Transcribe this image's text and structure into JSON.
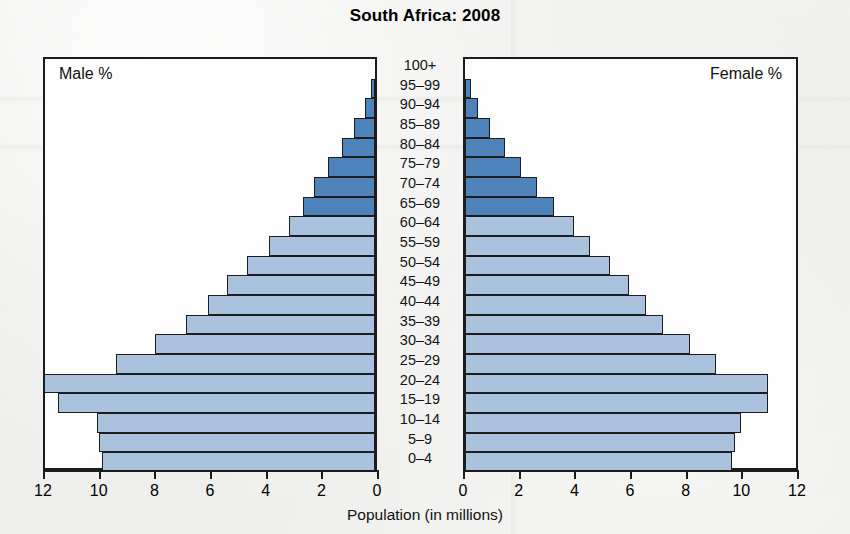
{
  "chart_data": {
    "type": "bar",
    "subtype": "population-pyramid",
    "title": "South Africa: 2008",
    "xlabel": "Population (in millions)",
    "ylabel": "",
    "grid": false,
    "legend_position": "inside-panels",
    "panels": [
      {
        "name": "male",
        "label": "Male %",
        "direction": "left"
      },
      {
        "name": "female",
        "label": "Female %",
        "direction": "right"
      }
    ],
    "axis": {
      "left_ticks": [
        12,
        10,
        8,
        6,
        4,
        2,
        0
      ],
      "right_ticks": [
        0,
        2,
        4,
        6,
        8,
        10,
        12
      ],
      "xlim": [
        0,
        12
      ],
      "units": "millions"
    },
    "categories": [
      "100+",
      "95–99",
      "90–94",
      "85–89",
      "80–84",
      "75–79",
      "70–74",
      "65–69",
      "60–64",
      "55–59",
      "50–54",
      "45–49",
      "40–44",
      "35–39",
      "30–34",
      "25–29",
      "20–24",
      "15–19",
      "10–14",
      "5–9",
      "0–4"
    ],
    "series": [
      {
        "name": "Male",
        "color": "#abc2de",
        "highlight_color": "#4d82bb",
        "values": [
          0.0,
          0.15,
          0.35,
          0.75,
          1.2,
          1.7,
          2.2,
          2.6,
          3.1,
          3.8,
          4.6,
          5.3,
          6.0,
          6.8,
          7.9,
          9.3,
          11.9,
          11.4,
          10.0,
          9.9,
          9.8
        ]
      },
      {
        "name": "Female",
        "color": "#abc2de",
        "highlight_color": "#4d82bb",
        "values": [
          0.0,
          0.2,
          0.45,
          0.9,
          1.45,
          2.0,
          2.6,
          3.2,
          3.9,
          4.5,
          5.2,
          5.9,
          6.5,
          7.1,
          8.1,
          9.0,
          10.9,
          10.9,
          9.9,
          9.7,
          9.6
        ]
      }
    ],
    "highlight_from_category": "65–69",
    "highlight_to_category": "95–99"
  }
}
